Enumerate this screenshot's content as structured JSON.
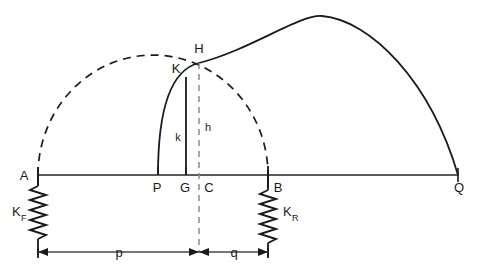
{
  "figure": {
    "type": "geometry-mechanics-diagram",
    "background_color": "#ffffff",
    "stroke_color": "#1a1a1a",
    "width": 480,
    "height": 279
  },
  "points": {
    "A": {
      "label": "A",
      "x": 38,
      "y": 175
    },
    "P": {
      "label": "P",
      "x": 158,
      "y": 175
    },
    "G": {
      "label": "G",
      "x": 186,
      "y": 175
    },
    "C": {
      "label": "C",
      "x": 199,
      "y": 175
    },
    "B": {
      "label": "B",
      "x": 268,
      "y": 175
    },
    "Q": {
      "label": "Q",
      "x": 458,
      "y": 175
    },
    "K": {
      "label": "K",
      "x": 186,
      "y": 77
    },
    "H": {
      "label": "H",
      "x": 199,
      "y": 63
    }
  },
  "dimensions": {
    "k": {
      "label": "k",
      "description": "vertical solid segment K to G"
    },
    "h": {
      "label": "h",
      "description": "vertical dashed segment H to C"
    },
    "p": {
      "label": "p",
      "description": "horizontal distance A to C"
    },
    "q": {
      "label": "q",
      "description": "horizontal distance C to B"
    }
  },
  "springs": {
    "front": {
      "label": "K",
      "subscript": "F",
      "anchor_point": "A"
    },
    "rear": {
      "label": "K",
      "subscript": "R",
      "anchor_point": "B"
    }
  },
  "curves": {
    "large_arc": {
      "style": "solid",
      "from": "P",
      "to": "Q",
      "passes_through": "H"
    },
    "semicircle": {
      "style": "dashed",
      "from": "A",
      "to": "B",
      "passes_through": "H"
    },
    "baseline": {
      "style": "solid",
      "from": "A",
      "to": "Q"
    }
  }
}
